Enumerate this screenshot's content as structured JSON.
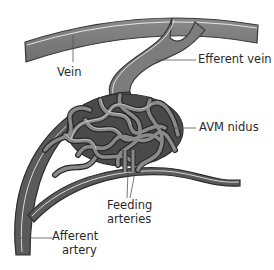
{
  "diagram": {
    "colors": {
      "vessel_fill": "#5a5a5a",
      "vessel_outline": "#2e2e2e",
      "vessel_highlight": "#d8d8d8",
      "leader_line": "#555555",
      "text": "#2a2a2a",
      "background": "#ffffff"
    },
    "labels": {
      "vein": "Vein",
      "efferent_vein": "Efferent vein",
      "avm_nidus": "AVM nidus",
      "feeding_arteries_line1": "Feeding",
      "feeding_arteries_line2": "arteries",
      "afferent_artery_line1": "Afferent",
      "afferent_artery_line2": "artery"
    }
  }
}
